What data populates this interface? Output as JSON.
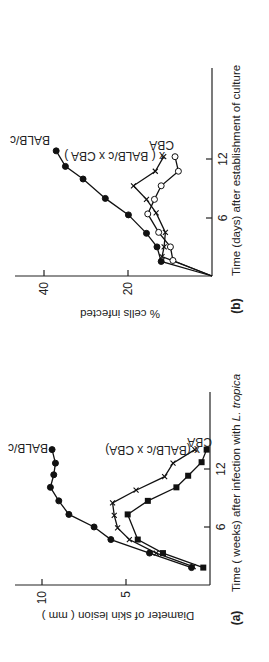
{
  "figure": {
    "orientation": "rotated-90-ccw"
  },
  "chart_data": [
    {
      "panel": "(a)",
      "type": "line",
      "title": "",
      "xlabel": "Time (weeks) after infection with L. tropica",
      "ylabel": "Diameter of skin lesion (mm)",
      "xticks": [
        6,
        12
      ],
      "yticks": [
        5,
        10
      ],
      "xlim": [
        0,
        20
      ],
      "ylim": [
        0,
        11.5
      ],
      "grid": false,
      "legend": "inline labels at line ends",
      "series": [
        {
          "name": "BALB/c",
          "marker": "filled-circle",
          "x": [
            1.8,
            3.3,
            4.7,
            6.0,
            7.3,
            8.7,
            10.1,
            11.4,
            12.6,
            14.0
          ],
          "y": [
            1.1,
            3.6,
            5.9,
            6.9,
            8.4,
            9.0,
            9.5,
            9.3,
            9.2,
            9.4
          ]
        },
        {
          "name": "(BALB/c x CBA)",
          "marker": "cross",
          "x": [
            1.9,
            3.3,
            4.7,
            5.9,
            7.2,
            8.5,
            9.8,
            11.2,
            12.6,
            14.0
          ],
          "y": [
            1.0,
            3.2,
            4.8,
            5.5,
            5.7,
            5.8,
            4.4,
            2.7,
            2.2,
            0.9
          ]
        },
        {
          "name": "CBA",
          "marker": "filled-square",
          "x": [
            1.8,
            3.3,
            4.7,
            7.3,
            8.7,
            10.1,
            11.3,
            12.7,
            14.0
          ],
          "y": [
            0.4,
            2.8,
            4.3,
            4.9,
            3.7,
            2.0,
            1.3,
            0.5,
            0.2
          ]
        }
      ]
    },
    {
      "panel": "(b)",
      "type": "line",
      "title": "",
      "xlabel": "Time (days) after establishment of culture",
      "ylabel": "% cells infected",
      "xticks": [
        6,
        12
      ],
      "yticks": [
        20,
        40
      ],
      "xlim": [
        0,
        21
      ],
      "ylim": [
        0,
        46
      ],
      "grid": false,
      "legend": "inline labels at line ends",
      "series": [
        {
          "name": "BALB/c",
          "marker": "filled-circle",
          "x": [
            0,
            1.5,
            3.0,
            4.4,
            6.3,
            8.0,
            10.0,
            11.3,
            12.9
          ],
          "y": [
            0,
            12.1,
            13.1,
            15.6,
            19.9,
            25.4,
            30.7,
            34.9,
            37.1
          ]
        },
        {
          "name": "(BALB/c x CBA)",
          "marker": "cross",
          "x": [
            0,
            2.0,
            3.0,
            4.5,
            6.5,
            7.9,
            9.3,
            10.8,
            12.3
          ],
          "y": [
            0,
            11.9,
            11.4,
            11.1,
            13.3,
            15.6,
            18.7,
            13.5,
            11.5
          ]
        },
        {
          "name": "CBA",
          "marker": "open-circle",
          "x": [
            0,
            1.6,
            3.0,
            4.5,
            6.4,
            7.9,
            9.3,
            10.8,
            12.3
          ],
          "y": [
            0,
            9.3,
            9.9,
            12.7,
            15.3,
            13.7,
            12.1,
            8.0,
            8.8
          ]
        }
      ]
    }
  ],
  "labels": {
    "a": {
      "panel": "(a)",
      "xlabel_main": "Time ( weeks) after infection with ",
      "xlabel_italic": "L. tropica",
      "ylabel": "Diameter of skin lesion  ( mm )",
      "xtick_6": "6",
      "xtick_12": "12",
      "ytick_5": "5",
      "ytick_10": "10",
      "series_balb": "BALB/c",
      "series_cross": "x (BALB/c x CBA)",
      "series_cba": "CBA"
    },
    "b": {
      "panel": "(b)",
      "xlabel": "Time (days) after establishment of culture",
      "ylabel": "%  cells infected",
      "xtick_6": "6",
      "xtick_12": "12",
      "ytick_20": "20",
      "ytick_40": "40",
      "series_balb": "BALB/c",
      "series_cross": "x  ( BALB/c x CBA )",
      "series_cba": "CBA"
    }
  }
}
